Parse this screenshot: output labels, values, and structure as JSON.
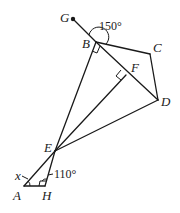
{
  "diagram": {
    "type": "geometry",
    "points": {
      "G": {
        "label": "G",
        "x": 73,
        "y": 19
      },
      "B": {
        "label": "B",
        "x": 96,
        "y": 42
      },
      "C": {
        "label": "C",
        "x": 150,
        "y": 54
      },
      "D": {
        "label": "D",
        "x": 158,
        "y": 100
      },
      "F": {
        "label": "F",
        "x": 126,
        "y": 75
      },
      "E": {
        "label": "E",
        "x": 55,
        "y": 151
      },
      "A": {
        "label": "A",
        "x": 24,
        "y": 186
      },
      "H": {
        "label": "H",
        "x": 45,
        "y": 186
      }
    },
    "angles": {
      "angle_gbc": "150°",
      "angle_ehx": "110°",
      "angle_x": "x"
    },
    "right_angles": [
      "B (EB ⊥ BD)",
      "F (EF ⊥ BD)",
      "H (AH ⊥ EH foot)"
    ],
    "segments": [
      "G-B",
      "B-D",
      "B-C",
      "C-D",
      "B-E",
      "E-F",
      "E-D",
      "E-A",
      "E-H",
      "A-H"
    ]
  }
}
